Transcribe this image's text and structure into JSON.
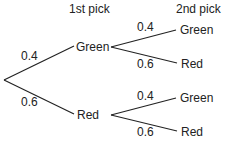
{
  "headers": {
    "first": "1st pick",
    "second": "2nd pick"
  },
  "first_level": [
    {
      "prob": "0.4",
      "outcome": "Green"
    },
    {
      "prob": "0.6",
      "outcome": "Red"
    }
  ],
  "second_level": {
    "after_green": [
      {
        "prob": "0.4",
        "outcome": "Green"
      },
      {
        "prob": "0.6",
        "outcome": "Red"
      }
    ],
    "after_red": [
      {
        "prob": "0.4",
        "outcome": "Green"
      },
      {
        "prob": "0.6",
        "outcome": "Red"
      }
    ]
  }
}
